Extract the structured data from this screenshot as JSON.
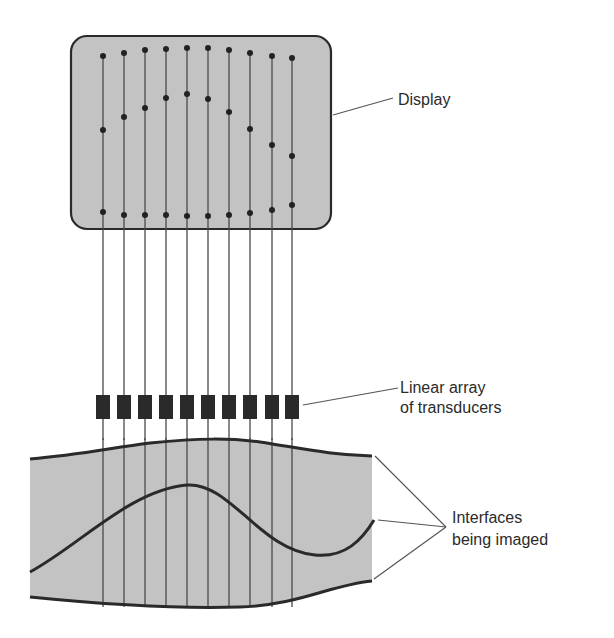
{
  "colors": {
    "fill": "#c3c3c3",
    "stroke": "#2a2a2a",
    "line": "#4a4a4a",
    "dot": "#222222",
    "transducer": "#2a2a2a",
    "background": "#ffffff"
  },
  "labels": {
    "display": "Display",
    "transducers_line1": "Linear array",
    "transducers_line2": "of transducers",
    "interfaces_line1": "Interfaces",
    "interfaces_line2": "being imaged"
  },
  "display_box": {
    "x": 71,
    "y": 36,
    "width": 260,
    "height": 193,
    "radius": 16
  },
  "scan_lines": {
    "x": [
      103,
      124,
      145,
      166,
      187,
      208,
      229,
      250,
      272,
      292
    ],
    "top_echo_y": [
      56,
      53,
      50,
      49,
      48,
      48,
      50,
      53,
      56,
      58
    ],
    "middle_echo_y": [
      130,
      117,
      108,
      98,
      94,
      99,
      112,
      129,
      145,
      156
    ],
    "bottom_echo_y": [
      212,
      215,
      215,
      215,
      216,
      216,
      215,
      213,
      210,
      205
    ]
  },
  "transducers": {
    "count": 10,
    "y": 395,
    "width": 14,
    "height": 24
  }
}
